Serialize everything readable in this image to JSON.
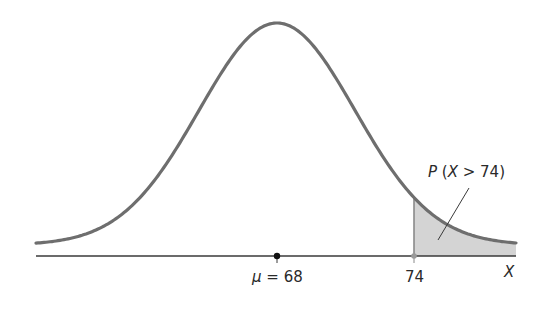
{
  "chart_data": {
    "type": "area",
    "title": "",
    "distribution": "normal",
    "mean": 68,
    "mean_label": "μ = 68",
    "threshold": 74,
    "threshold_label": "74",
    "shaded_region_label": "P (X > 74)",
    "shaded_region": "X > 74",
    "xlabel": "X",
    "ylabel": "",
    "grid": false,
    "legend": "none"
  },
  "colors": {
    "curve": "#6e6e6e",
    "axis": "#3a3a3a",
    "shade": "#d4d4d4",
    "text": "#2a2a2a",
    "mean_marker": "#111111",
    "threshold_marker": "#888888"
  },
  "labels": {
    "mean": "μ = 68",
    "threshold": "74",
    "axis": "X",
    "probability": "P (X > 74)"
  }
}
